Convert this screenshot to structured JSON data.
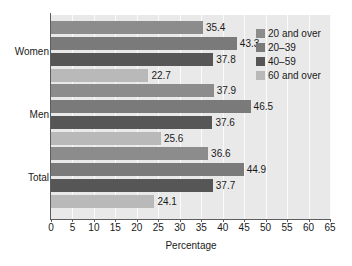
{
  "chart_data": {
    "type": "bar",
    "orientation": "horizontal",
    "title": "",
    "xlabel": "Percentage",
    "ylabel": "",
    "xlim": [
      0,
      65
    ],
    "xticks": [
      0,
      5,
      10,
      15,
      20,
      25,
      30,
      35,
      40,
      45,
      50,
      55,
      60,
      65
    ],
    "grid": true,
    "legend_position": "top-right",
    "categories": [
      "Women",
      "Men",
      "Total"
    ],
    "series": [
      {
        "name": "20 and over",
        "color": "#8c8c8c",
        "values": [
          35.4,
          37.9,
          36.6
        ]
      },
      {
        "name": "20–39",
        "color": "#7a7a7a",
        "values": [
          43.3,
          46.5,
          44.9
        ]
      },
      {
        "name": "40–59",
        "color": "#565656",
        "values": [
          37.8,
          37.6,
          37.7
        ]
      },
      {
        "name": "60 and over",
        "color": "#b9b9b9",
        "values": [
          22.7,
          25.6,
          24.1
        ]
      }
    ],
    "data_labels": [
      [
        "35.4",
        "43.3",
        "37.8",
        "22.7"
      ],
      [
        "37.9",
        "46.5",
        "37.6",
        "25.6"
      ],
      [
        "36.6",
        "44.9",
        "37.7",
        "24.1"
      ]
    ]
  },
  "legend": {
    "items": [
      {
        "label": "20 and over"
      },
      {
        "label": "20–39"
      },
      {
        "label": "40–59"
      },
      {
        "label": "60 and over"
      }
    ]
  },
  "axis": {
    "x_title": "Percentage",
    "tick_labels": [
      "0",
      "5",
      "10",
      "15",
      "20",
      "25",
      "30",
      "35",
      "40",
      "45",
      "50",
      "55",
      "60",
      "65"
    ],
    "category_labels": [
      "Women",
      "Men",
      "Total"
    ]
  },
  "colors": {
    "plot_background": "#e9e9e9",
    "gridline": "#fbfbfb",
    "axis": "#5d5d5d",
    "text": "#1a1a1a",
    "page_background": "#ffffff"
  }
}
